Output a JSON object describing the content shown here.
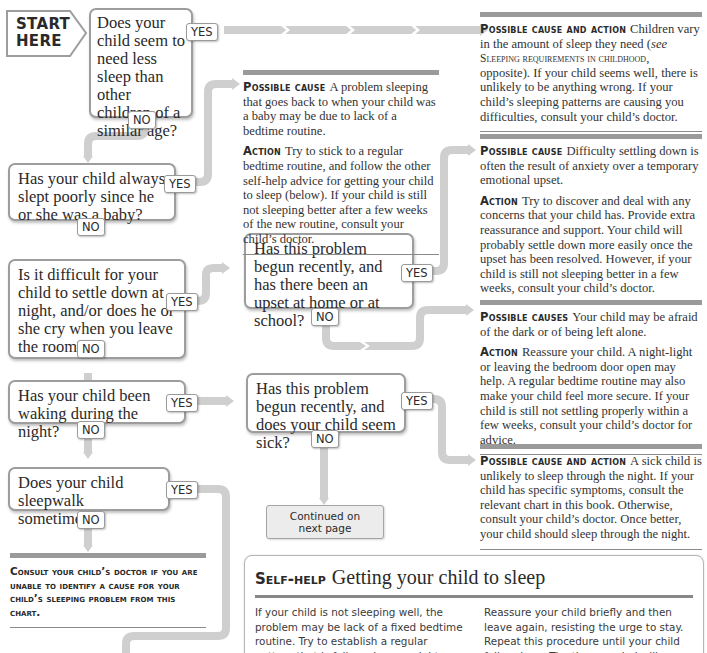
{
  "start": {
    "label": "START\nHERE"
  },
  "tags": {
    "yes": "YES",
    "no": "NO"
  },
  "questions": [
    {
      "id": "q1",
      "text": "Does your child seem to need less sleep than other children of a similar age?"
    },
    {
      "id": "q2",
      "text": "Has your child always slept poorly since he or she was a baby?"
    },
    {
      "id": "q3",
      "text": "Is it difficult for your child to settle down at night, and/or does he or she cry when you leave the room?"
    },
    {
      "id": "q4",
      "text": "Has your child been waking during the night?"
    },
    {
      "id": "q5",
      "text": "Does your child sleepwalk sometimes?"
    },
    {
      "id": "q6",
      "text": "Has this problem begun recently, and has there been an upset at home or at school?"
    },
    {
      "id": "q7",
      "text": "Has this problem begun recently, and does your child seem sick?"
    }
  ],
  "results": {
    "r1": {
      "label": "Possible cause and action",
      "text_a": "Children vary in the amount of sleep they need (",
      "see": "see",
      "ref": "Sleeping requirements in childhood",
      "text_b": ", opposite). If your child seems well, there is unlikely to be anything wrong. If your child’s sleeping patterns are causing you difficulties, consult your child’s doctor."
    },
    "r2": {
      "cause_label": "Possible cause",
      "cause": "A problem sleeping that goes back to when your child was a baby may be due to lack of a bedtime routine.",
      "action_label": "Action",
      "action": "Try to stick to a regular bedtime routine, and follow the other self-help advice for getting your child to sleep (below). If your child is still not sleeping better after a few weeks of the new routine, consult your child’s doctor."
    },
    "r3": {
      "cause_label": "Possible cause",
      "cause": "Difficulty settling down is often the result of anxiety over a temporary emotional upset.",
      "action_label": "Action",
      "action": "Try to discover and deal with any concerns that your child has. Provide extra reassurance and support. Your child will probably settle down more easily once the upset has been resolved. However, if your child is still not sleeping better in a few weeks, consult your child’s doctor."
    },
    "r4": {
      "cause_label": "Possible causes",
      "cause": "Your child may be afraid of the dark or of being left alone.",
      "action_label": "Action",
      "action": "Reassure your child. A night-light or leaving the bedroom door open may help. A regular bedtime routine may also make your child feel more secure. If your child is still not settling properly within a few weeks, consult your child’s doctor for advice."
    },
    "r5": {
      "label": "Possible cause and action",
      "text": "A sick child is unlikely to sleep through the night. If your child has specific symptoms, consult the relevant chart in this book. Otherwise, consult your child’s doctor. Once better, your child should sleep through the night."
    }
  },
  "consult": {
    "text": "Consult your child’s doctor if you are unable to identify a cause for your child’s sleeping problem from this chart."
  },
  "continued": {
    "line1": "Continued on",
    "line2": "next page"
  },
  "self_help": {
    "kicker": "Self-help",
    "title": "Getting your child to sleep",
    "col1": "If your child is not sleeping well, the problem may be lack of a fixed bedtime routine. Try to establish a regular pattern that is followed every night, such as a bath and then a story.",
    "col2": "Reassure your child briefly and then leave again, resisting the urge to stay. Repeat this procedure until your child falls asleep. The time needed will shorten each day."
  },
  "colors": {
    "connector": "#cfcfcf",
    "box_border": "#9d9d9d",
    "bar": "#9a9a9a"
  }
}
